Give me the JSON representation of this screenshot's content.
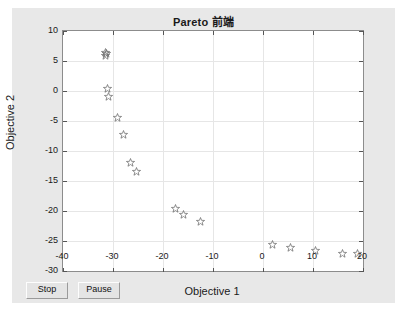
{
  "figure": {
    "title": "Pareto 前端",
    "background_color": "#e8e8e8",
    "axes_background": "#ffffff"
  },
  "buttons": {
    "stop_label": "Stop",
    "pause_label": "Pause"
  },
  "chart_data": {
    "type": "scatter",
    "title": "Pareto 前端",
    "xlabel": "Objective 1",
    "ylabel": "Objective 2",
    "xlim": [
      -40,
      20
    ],
    "ylim": [
      -30,
      10
    ],
    "xticks": [
      -40,
      -30,
      -20,
      -10,
      0,
      10,
      20
    ],
    "yticks": [
      10,
      5,
      0,
      -5,
      -10,
      -15,
      -20,
      -25,
      -30
    ],
    "xtick_labels": [
      "-40",
      "-30",
      "-20",
      "-10",
      "0",
      "10",
      "20"
    ],
    "ytick_labels": [
      "10",
      "5",
      "0",
      "-5",
      "-10",
      "-15",
      "-20",
      "-25",
      "-30"
    ],
    "grid": true,
    "legend": null,
    "marker": "pentagram",
    "marker_color": "#666666",
    "series": [
      {
        "name": "Pareto front",
        "points": [
          [
            -31.6,
            6.4
          ],
          [
            -31.4,
            6.2
          ],
          [
            -31.5,
            6.0
          ],
          [
            -31.2,
            0.5
          ],
          [
            -30.9,
            -0.9
          ],
          [
            -29.1,
            -4.4
          ],
          [
            -28.0,
            -7.2
          ],
          [
            -26.5,
            -11.9
          ],
          [
            -25.4,
            -13.4
          ],
          [
            -17.6,
            -19.5
          ],
          [
            -15.9,
            -20.5
          ],
          [
            -12.6,
            -21.8
          ],
          [
            1.9,
            -25.5
          ],
          [
            5.5,
            -26.1
          ],
          [
            10.4,
            -26.6
          ],
          [
            15.8,
            -27.1
          ],
          [
            18.9,
            -27.1
          ]
        ]
      }
    ]
  }
}
